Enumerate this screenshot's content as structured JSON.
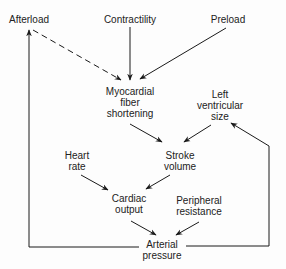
{
  "diagram": {
    "nodes": [
      {
        "id": "afterload",
        "lines": [
          "Afterload"
        ],
        "x": 29,
        "y": 14
      },
      {
        "id": "contractility",
        "lines": [
          "Contractility"
        ],
        "x": 130,
        "y": 14
      },
      {
        "id": "preload",
        "lines": [
          "Preload"
        ],
        "x": 228,
        "y": 14
      },
      {
        "id": "myocardial_fiber_shortening",
        "lines": [
          "Myocardial",
          "fiber",
          "shortening"
        ],
        "x": 130,
        "y": 86
      },
      {
        "id": "left_ventricular_size",
        "lines": [
          "Left",
          "ventricular",
          "size"
        ],
        "x": 220,
        "y": 89
      },
      {
        "id": "heart_rate",
        "lines": [
          "Heart",
          "rate"
        ],
        "x": 77,
        "y": 150
      },
      {
        "id": "stroke_volume",
        "lines": [
          "Stroke",
          "volume"
        ],
        "x": 180,
        "y": 150
      },
      {
        "id": "cardiac_output",
        "lines": [
          "Cardiac",
          "output"
        ],
        "x": 129,
        "y": 193
      },
      {
        "id": "peripheral_resistance",
        "lines": [
          "Peripheral",
          "resistance"
        ],
        "x": 199,
        "y": 195
      },
      {
        "id": "arterial_pressure",
        "lines": [
          "Arterial",
          "pressure"
        ],
        "x": 162,
        "y": 239
      }
    ],
    "edges": [
      {
        "from": "afterload",
        "to": "myocardial_fiber_shortening",
        "style": "dashed"
      },
      {
        "from": "contractility",
        "to": "myocardial_fiber_shortening",
        "style": "solid"
      },
      {
        "from": "preload",
        "to": "myocardial_fiber_shortening",
        "style": "solid"
      },
      {
        "from": "myocardial_fiber_shortening",
        "to": "stroke_volume",
        "style": "solid"
      },
      {
        "from": "left_ventricular_size",
        "to": "stroke_volume",
        "style": "solid"
      },
      {
        "from": "heart_rate",
        "to": "cardiac_output",
        "style": "solid"
      },
      {
        "from": "stroke_volume",
        "to": "cardiac_output",
        "style": "solid"
      },
      {
        "from": "cardiac_output",
        "to": "arterial_pressure",
        "style": "solid"
      },
      {
        "from": "peripheral_resistance",
        "to": "arterial_pressure",
        "style": "solid"
      },
      {
        "from": "arterial_pressure",
        "to": "afterload",
        "style": "solid",
        "route": "left-loop"
      },
      {
        "from": "arterial_pressure",
        "to": "left_ventricular_size",
        "style": "solid",
        "route": "right-loop"
      }
    ],
    "colors": {
      "line": "#1a1a1a",
      "text": "#222222",
      "background": "#fdfdfd"
    }
  }
}
